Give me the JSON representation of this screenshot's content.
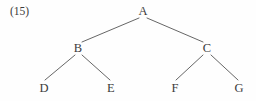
{
  "figure": {
    "example_number": "(15)",
    "caption": "",
    "background_color": "#fefefe",
    "line_color": "#555555",
    "text_color": "#3b3b3b"
  },
  "chart_data": {
    "type": "diagram",
    "subtype": "tree",
    "title": "",
    "nodes": [
      {
        "id": "A",
        "label": "A",
        "x": 143,
        "y": 11,
        "level": 0,
        "parent": null
      },
      {
        "id": "B",
        "label": "B",
        "x": 78,
        "y": 48,
        "level": 1,
        "parent": "A"
      },
      {
        "id": "C",
        "label": "C",
        "x": 207,
        "y": 48,
        "level": 1,
        "parent": "A"
      },
      {
        "id": "D",
        "label": "D",
        "x": 44,
        "y": 88,
        "level": 2,
        "parent": "B"
      },
      {
        "id": "E",
        "label": "E",
        "x": 111,
        "y": 88,
        "level": 2,
        "parent": "B"
      },
      {
        "id": "F",
        "label": "F",
        "x": 175,
        "y": 88,
        "level": 2,
        "parent": "C"
      },
      {
        "id": "G",
        "label": "G",
        "x": 239,
        "y": 88,
        "level": 2,
        "parent": "C"
      }
    ],
    "edges": [
      {
        "from": "A",
        "to": "B",
        "x1": 139,
        "y1": 18,
        "x2": 82,
        "y2": 42
      },
      {
        "from": "A",
        "to": "C",
        "x1": 147,
        "y1": 18,
        "x2": 203,
        "y2": 42
      },
      {
        "from": "B",
        "to": "D",
        "x1": 75,
        "y1": 55,
        "x2": 45,
        "y2": 80
      },
      {
        "from": "B",
        "to": "E",
        "x1": 82,
        "y1": 55,
        "x2": 110,
        "y2": 80
      },
      {
        "from": "C",
        "to": "F",
        "x1": 203,
        "y1": 55,
        "x2": 176,
        "y2": 80
      },
      {
        "from": "C",
        "to": "G",
        "x1": 211,
        "y1": 55,
        "x2": 238,
        "y2": 80
      }
    ]
  }
}
